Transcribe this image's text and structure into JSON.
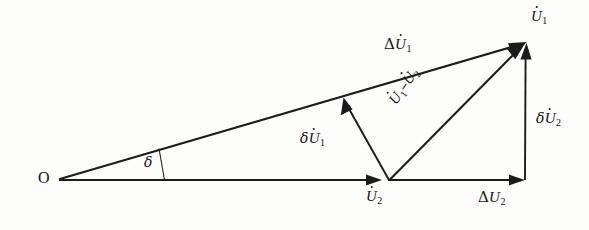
{
  "figure": {
    "type": "phasor-vector-diagram",
    "background_color": "#fdfdfc",
    "line_color": "#1b1b1b",
    "text_color": "#121212"
  },
  "labels": {
    "origin": "O",
    "delta_angle": "δ",
    "delta_U1_dot": {
      "delta": "Δ",
      "base": "U",
      "dot": true,
      "sub": "1"
    },
    "U1_dot": {
      "base": "U",
      "dot": true,
      "sub": "1"
    },
    "U2_dot": {
      "base": "U",
      "dot": true,
      "sub": "2"
    },
    "small_delta_U1_dot": {
      "delta": "δ",
      "base": "U",
      "dot": true,
      "sub": "1"
    },
    "small_delta_U2_dot": {
      "delta": "δ",
      "base": "U",
      "dot": true,
      "sub": "2"
    },
    "U1_minus_U2": {
      "first": "U",
      "sub1": "1",
      "operator": "–",
      "second": "U",
      "sub2": "2"
    },
    "delta_U2_plain": {
      "delta": "Δ",
      "base": "U",
      "dot": false,
      "sub": "2"
    }
  },
  "label_text": {
    "origin": "O",
    "delta_angle": "δ",
    "delta_U1_dot": "ΔU̇1",
    "U1_dot": "U̇1",
    "U2_dot": "U̇2",
    "small_delta_U1_dot": "δU̇1",
    "small_delta_U2_dot": "δU̇2",
    "U1_minus_U2": "U̇1–U̇2",
    "delta_U2_plain": "ΔU2"
  },
  "geometry": {
    "origin": {
      "x": 57,
      "y": 180
    },
    "u1_tip": {
      "x": 527,
      "y": 42
    },
    "baseline_tip": {
      "x": 524,
      "y": 180
    },
    "u2_tip": {
      "x": 381,
      "y": 180
    },
    "branch_point": {
      "x": 388,
      "y": 180
    },
    "delta_u1_head": {
      "x": 344,
      "y": 97
    },
    "angle_marker_base": {
      "x": 165,
      "y": 180
    },
    "angle_marker_top": {
      "x": 160,
      "y": 149
    },
    "delta_angle_degrees": 16.4
  },
  "vectors": [
    {
      "name": "delta-U1-vector",
      "from": "origin",
      "to": "u1_tip",
      "label": "ΔU̇1"
    },
    {
      "name": "U2-vector",
      "from": "origin",
      "to": "u2_tip",
      "label": "U̇2"
    },
    {
      "name": "delta-U2-baseline-vector",
      "from": "u2_tip",
      "to": "baseline_tip",
      "label": "ΔU2"
    },
    {
      "name": "delta-U2-vertical-vector",
      "from": "baseline_tip",
      "to": "u1_tip",
      "label": "δU̇2"
    },
    {
      "name": "delta-U1-small-vector",
      "from": "branch_point",
      "to": "delta_u1_head",
      "label": "δU̇1"
    },
    {
      "name": "U1-minus-U2-vector",
      "from": "branch_point",
      "to": "u1_tip",
      "label": "U̇1–U̇2"
    }
  ]
}
